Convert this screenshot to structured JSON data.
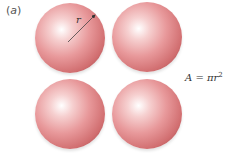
{
  "figure": {
    "panel_label": "(a)",
    "panel_letter": "a",
    "radius_label": "r",
    "formula": {
      "lhs": "A",
      "eq": " = ",
      "rhs_base": "πr",
      "rhs_exp": "2"
    },
    "spheres": [
      {
        "id": "top-left",
        "cx": 70,
        "cy": 38,
        "r": 35,
        "shows_radius": true
      },
      {
        "id": "top-right",
        "cx": 147,
        "cy": 37,
        "r": 35,
        "shows_radius": false
      },
      {
        "id": "bottom-left",
        "cx": 70,
        "cy": 114,
        "r": 35,
        "shows_radius": false
      },
      {
        "id": "bottom-right",
        "cx": 147,
        "cy": 114,
        "r": 35,
        "shows_radius": false
      }
    ],
    "colors": {
      "sphere_highlight": "#ffffff",
      "sphere_mid": "#e8999b",
      "sphere_edge": "#6e3436",
      "text": "#333333"
    }
  }
}
